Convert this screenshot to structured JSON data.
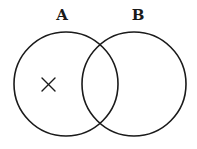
{
  "diagram": {
    "type": "venn",
    "sets": [
      {
        "label": "A",
        "cx": 66,
        "cy": 84,
        "r": 52,
        "label_x": 62,
        "label_y": 20
      },
      {
        "label": "B",
        "cx": 134,
        "cy": 84,
        "r": 52,
        "label_x": 138,
        "label_y": 20
      }
    ],
    "marks": [
      {
        "symbol": "×",
        "region": "A only",
        "x": 48,
        "y": 84
      }
    ],
    "stroke_color": "#1a1a1a",
    "background": "#ffffff"
  }
}
